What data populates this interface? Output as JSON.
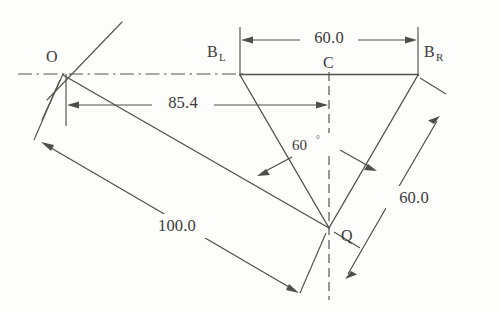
{
  "diagram": {
    "points": [
      {
        "id": "O",
        "label": "O",
        "sub": "",
        "x": 63,
        "y": 73
      },
      {
        "id": "BL",
        "label": "B",
        "sub": "L",
        "x": 240,
        "y": 74
      },
      {
        "id": "C",
        "label": "C",
        "sub": "",
        "x": 329,
        "y": 74
      },
      {
        "id": "BR",
        "label": "B",
        "sub": "R",
        "x": 418,
        "y": 74
      },
      {
        "id": "Q",
        "label": "Q",
        "sub": "",
        "x": 329,
        "y": 228
      }
    ],
    "dimensions": [
      {
        "id": "top-width",
        "value": "60.0",
        "from": "BL",
        "to": "BR"
      },
      {
        "id": "offset",
        "value": "85.4",
        "from": "O",
        "to": "C"
      },
      {
        "id": "right-leg",
        "value": "60.0",
        "from": "BR",
        "to": "Q"
      },
      {
        "id": "long-arm",
        "value": "100.0",
        "from": "O",
        "to": "Q"
      }
    ],
    "angles": [
      {
        "id": "apex-angle",
        "value": "60",
        "unit": "°",
        "at": "Q"
      }
    ],
    "labels": {
      "O": "O",
      "C": "C",
      "Q": "Q",
      "BL_base": "B",
      "BL_sub": "L",
      "BR_base": "B",
      "BR_sub": "R",
      "dim_60_top": "60.0",
      "dim_85_4": "85.4",
      "dim_60_right": "60.0",
      "dim_100": "100.0",
      "angle_60": "60",
      "angle_deg_symbol": "°"
    },
    "colors": {
      "line": "#50504e",
      "text": "#3a3a38",
      "background": "#fdfdfb"
    }
  }
}
